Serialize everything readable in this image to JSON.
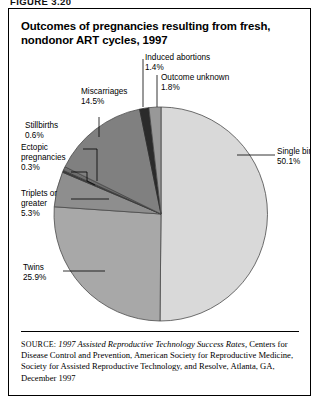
{
  "figure": {
    "number": "FIGURE 3.20",
    "title": "Outcomes of pregnancies resulting from fresh, nondonor ART cycles, 1997"
  },
  "source": {
    "label": "SOURCE:",
    "italic_part": "1997 Assisted Reproductive Technology Success Rates,",
    "rest": " Centers for Disease Control and Prevention, American Society for Reproductive Medicine, Society for Assisted Reproductive Technology, and Resolve, Atlanta, GA, December 1997"
  },
  "labels": {
    "single_births": "Single births\n50.1%",
    "twins": "Twins\n25.9%",
    "triplets": "Triplets or\ngreater\n5.3%",
    "ectopic": "Ectopic\npregnancies\n0.3%",
    "stillbirths": "Stillbirths\n0.6%",
    "miscarriages": "Miscarriages\n14.5%",
    "induced_abortions": "Induced abortions\n1.4%",
    "outcome_unknown": "Outcome unknown\n1.8%"
  },
  "chart_data": {
    "type": "pie",
    "title": "Outcomes of pregnancies resulting from fresh, nondonor ART cycles, 1997",
    "xlabel": "",
    "ylabel": "",
    "units": "percent",
    "start_angle_deg": 0,
    "direction": "clockwise",
    "legend": "none (direct labels with leader lines)",
    "grid": false,
    "categories": [
      "Single births",
      "Twins",
      "Triplets or greater",
      "Ectopic pregnancies",
      "Stillbirths",
      "Miscarriages",
      "Induced abortions",
      "Outcome unknown"
    ],
    "values": [
      50.1,
      25.9,
      5.3,
      0.3,
      0.6,
      14.5,
      1.4,
      1.8
    ],
    "value_labels": [
      "50.1%",
      "25.9%",
      "5.3%",
      "0.3%",
      "0.6%",
      "14.5%",
      "1.4%",
      "1.8%"
    ],
    "slice_colors": [
      "#d9d9d9",
      "#a8a8a8",
      "#8e8e8e",
      "#3a3a3a",
      "#6e6e6e",
      "#808080",
      "#2b2b2b",
      "#989898"
    ],
    "total": 99.9
  },
  "colors": {
    "border": "#000000",
    "background": "#ffffff",
    "text": "#000000",
    "leader_line": "#000000"
  }
}
